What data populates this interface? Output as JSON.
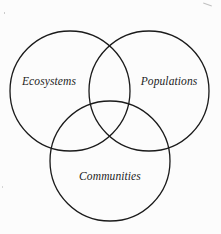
{
  "diagram": {
    "type": "venn",
    "sets": [
      {
        "id": "ecosystems",
        "label": "Ecosystems",
        "circle": {
          "cx": 70,
          "cy": 91,
          "r": 60
        },
        "label_pos": {
          "x": 49,
          "y": 81
        }
      },
      {
        "id": "populations",
        "label": "Populations",
        "circle": {
          "cx": 149,
          "cy": 91,
          "r": 60
        },
        "label_pos": {
          "x": 169,
          "y": 81
        }
      },
      {
        "id": "communities",
        "label": "Communities",
        "circle": {
          "cx": 110,
          "cy": 161,
          "r": 60
        },
        "label_pos": {
          "x": 110,
          "y": 176
        }
      }
    ],
    "colors": {
      "stroke": "#1a1a1a",
      "text": "#1c1c1c",
      "background": "#fcfcfc"
    }
  }
}
